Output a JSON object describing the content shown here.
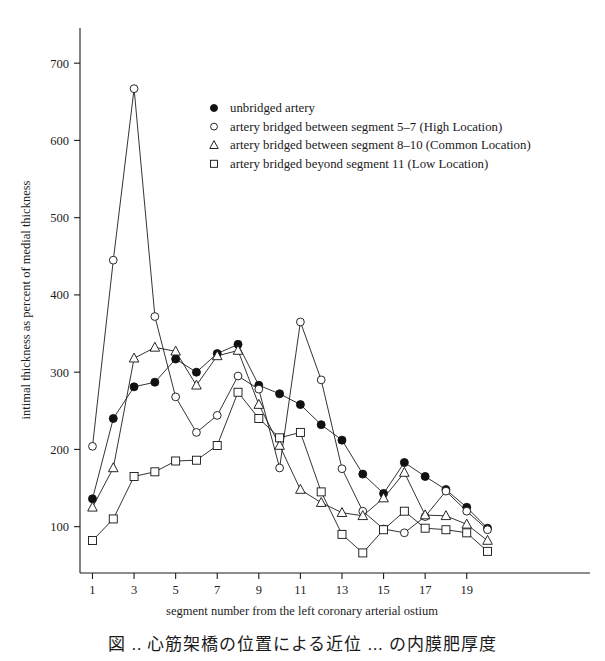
{
  "figure": {
    "caption": "図 ..  心筋架橋の位置による近位 ... の内膜肥厚度"
  },
  "legend": {
    "items": [
      {
        "marker": "filled-circle",
        "label": "unbridged artery"
      },
      {
        "marker": "open-circle",
        "label": "artery bridged between segment 5–7 (High Location)"
      },
      {
        "marker": "open-triangle",
        "label": "artery bridged between segment 8–10 (Common Location)"
      },
      {
        "marker": "open-square",
        "label": "artery bridged beyond segment 11 (Low Location)"
      }
    ]
  },
  "chart_data": {
    "type": "line",
    "title": "",
    "xlabel": "segment number from the left coronary arterial ostium",
    "ylabel": "intimal thickness as percent of medial thickness",
    "xlim": [
      0.4,
      20.6
    ],
    "ylim": [
      40,
      730
    ],
    "xticks": [
      1,
      3,
      5,
      7,
      9,
      11,
      13,
      15,
      17,
      19
    ],
    "yticks": [
      100,
      200,
      300,
      400,
      500,
      600,
      700
    ],
    "grid": false,
    "legend_position": "upper-center-right",
    "x": [
      1,
      2,
      3,
      4,
      5,
      6,
      7,
      8,
      9,
      10,
      11,
      12,
      13,
      14,
      15,
      16,
      17,
      18,
      19,
      20
    ],
    "series": [
      {
        "name": "unbridged artery",
        "marker": "filled-circle",
        "values": [
          136,
          240,
          281,
          287,
          317,
          300,
          324,
          336,
          283,
          272,
          258,
          232,
          212,
          168,
          143,
          183,
          165,
          148,
          125,
          98
        ]
      },
      {
        "name": "artery bridged between segment 5–7 (High Location)",
        "marker": "open-circle",
        "values": [
          204,
          445,
          667,
          372,
          268,
          222,
          244,
          295,
          278,
          176,
          365,
          290,
          175,
          120,
          97,
          92,
          113,
          146,
          120,
          96
        ]
      },
      {
        "name": "artery bridged between segment 8–10 (Common Location)",
        "marker": "open-triangle",
        "values": [
          125,
          176,
          318,
          332,
          327,
          283,
          321,
          328,
          258,
          205,
          148,
          131,
          118,
          114,
          137,
          170,
          115,
          114,
          103,
          82
        ]
      },
      {
        "name": "artery bridged beyond segment 11 (Low Location)",
        "marker": "open-square",
        "values": [
          82,
          110,
          165,
          171,
          185,
          186,
          205,
          274,
          240,
          215,
          222,
          145,
          90,
          66,
          96,
          120,
          98,
          96,
          92,
          68
        ]
      }
    ]
  }
}
